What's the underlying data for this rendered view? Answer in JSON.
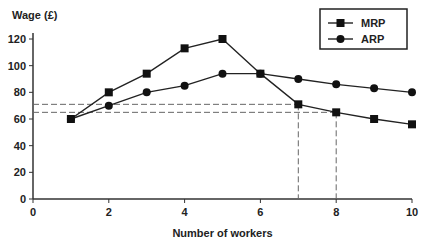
{
  "chart_data": {
    "type": "line",
    "title": "",
    "xlabel": "Number of workers",
    "ylabel": "Wage (£)",
    "xlim": [
      0,
      10
    ],
    "ylim": [
      0,
      120
    ],
    "x_ticks": [
      0,
      2,
      4,
      6,
      8,
      10
    ],
    "y_ticks": [
      0,
      20,
      40,
      60,
      80,
      100,
      120
    ],
    "x": [
      1,
      2,
      3,
      4,
      5,
      6,
      7,
      8,
      9,
      10
    ],
    "series": [
      {
        "name": "MRP",
        "marker": "square",
        "values": [
          60,
          80,
          94,
          113,
          120,
          94,
          71,
          65,
          60,
          56
        ]
      },
      {
        "name": "ARP",
        "marker": "circle",
        "values": [
          60,
          70,
          80,
          85,
          94,
          94,
          90,
          86,
          83,
          80
        ]
      }
    ],
    "reference_lines": [
      {
        "type": "dashed",
        "y": 71,
        "x": 7
      },
      {
        "type": "dashed",
        "y": 65,
        "x": 8
      }
    ],
    "grid": false,
    "legend_position": "top-right"
  },
  "labels": {
    "ylabel": "Wage (£)",
    "xlabel": "Number of workers",
    "legend_mrp": "MRP",
    "legend_arp": "ARP"
  }
}
